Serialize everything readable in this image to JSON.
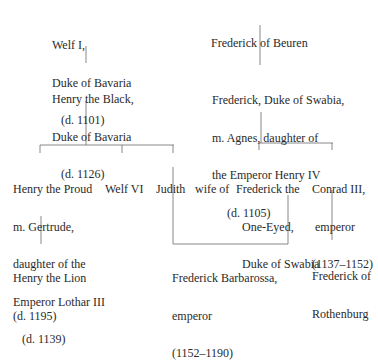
{
  "nodes": {
    "welf1": {
      "lines": [
        "Welf I,",
        "Duke of Bavaria",
        "   (d. 1101)"
      ]
    },
    "henry_black": {
      "lines": [
        "Henry the Black,",
        "Duke of Bavaria",
        "   (d. 1126)"
      ]
    },
    "frederick_beuren": {
      "lines": [
        "Frederick of Beuren"
      ]
    },
    "frederick_swabia": {
      "lines": [
        "Frederick, Duke of Swabia,",
        "m. Agnes, daughter of",
        "the Emperor Henry IV",
        "     (d. 1105)"
      ]
    },
    "henry_proud": {
      "lines": [
        "Henry the Proud",
        "m. Gertrude,",
        "daughter of the",
        "Emperor Lothar III",
        "   (d. 1139)"
      ]
    },
    "welf6": {
      "lines": [
        "Welf VI"
      ]
    },
    "judith": {
      "lines": [
        "Judith"
      ]
    },
    "wife_of": {
      "lines": [
        "wife of"
      ]
    },
    "frederick_one_eyed": {
      "lines": [
        "Frederick the",
        "  One-Eyed,",
        "  Duke of Swabia"
      ]
    },
    "conrad3": {
      "lines": [
        "Conrad III,",
        " emperor",
        "(1137–1152)"
      ]
    },
    "henry_lion": {
      "lines": [
        "Henry the Lion",
        "(d. 1195)"
      ]
    },
    "barbarossa": {
      "lines": [
        "Frederick Barbarossa,",
        "emperor",
        "(1152–1190)"
      ]
    },
    "frederick_rothenburg": {
      "lines": [
        "Frederick of",
        "Rothenburg"
      ]
    }
  },
  "colors": {
    "text": "#2a2a2a",
    "lines": "#6a6a6a",
    "background": "#ffffff"
  }
}
